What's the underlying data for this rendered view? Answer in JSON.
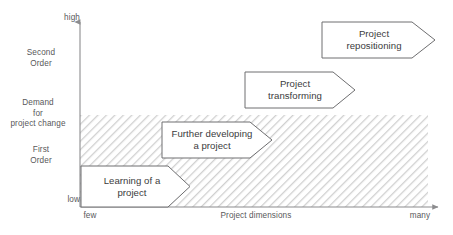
{
  "diagram": {
    "axes": {
      "y": {
        "label_top": "high",
        "label_bottom": "low",
        "title": "Demand\nfor\nproject change",
        "bands": [
          {
            "name": "second-order",
            "label": "Second\nOrder"
          },
          {
            "name": "first-order",
            "label": "First\nOrder"
          }
        ]
      },
      "x": {
        "title": "Project dimensions",
        "label_left": "few",
        "label_right": "many"
      }
    },
    "hatched_region": {
      "name": "first-order-band",
      "fill": "#d9d9d9"
    },
    "arrows": [
      {
        "id": "learning",
        "label": "Learning of a\nproject"
      },
      {
        "id": "further",
        "label": "Further developing\na project"
      },
      {
        "id": "transforming",
        "label": "Project\ntransforming"
      },
      {
        "id": "repositioning",
        "label": "Project\nrepositioning"
      }
    ],
    "colors": {
      "axis": "#8c8c8e",
      "arrow_stroke": "#6e6e70",
      "text": "#58585a",
      "arrow_text": "#3b3b3d",
      "hatch": "#d6d6d6"
    }
  }
}
